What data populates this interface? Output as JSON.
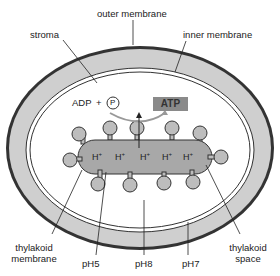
{
  "diagram": {
    "labels": {
      "outer_membrane": "outer membrane",
      "inner_membrane": "inner membrane",
      "stroma": "stroma",
      "adp": "ADP",
      "plus": "+",
      "phosphate": "P",
      "atp": "ATP",
      "thylakoid_membrane": "thylakoid membrane",
      "thylakoid_space": "thylakoid space",
      "ph5": "pH5",
      "ph8": "pH8",
      "ph7": "pH7"
    },
    "protons": [
      "H+",
      "H+",
      "H+",
      "H+",
      "H+"
    ],
    "colors": {
      "outer_membrane": "#333333",
      "intermembrane": "#cfcfcf",
      "thylakoid": "#a8a8a8",
      "atp_box": "#8a8a8a",
      "background": "#ffffff"
    }
  }
}
